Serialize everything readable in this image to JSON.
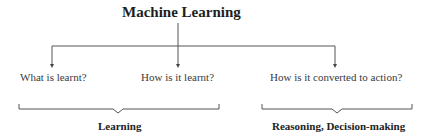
{
  "diagram": {
    "title": "Machine Learning",
    "branches": [
      {
        "label": "What is learnt?"
      },
      {
        "label": "How is it learnt?"
      },
      {
        "label": "How is it converted to action?"
      }
    ],
    "groups": [
      {
        "label": "Learning",
        "covers": [
          "What is learnt?",
          "How is it learnt?"
        ]
      },
      {
        "label": "Reasoning, Decision-making",
        "covers": [
          "How is it converted to action?"
        ]
      }
    ],
    "colors": {
      "line": "#555555",
      "text": "#2a2a2a",
      "background": "#ffffff"
    }
  }
}
